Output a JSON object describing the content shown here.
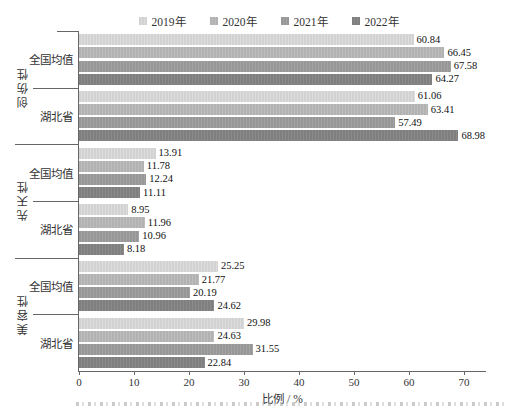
{
  "chart_data": {
    "type": "bar",
    "orientation": "horizontal",
    "title": "",
    "xlabel": "比例 / %",
    "xlim": [
      0,
      72
    ],
    "xticks": [
      0,
      10,
      20,
      30,
      40,
      50,
      60,
      70
    ],
    "grid": false,
    "legend_position": "top",
    "legend": [
      "2019年",
      "2020年",
      "2021年",
      "2022年"
    ],
    "series_colors": [
      "#d2d2d2",
      "#b2b2b2",
      "#979797",
      "#7f7f7f"
    ],
    "series_stripe_colors": [
      "#dddddd",
      "#bebebe",
      "#a3a3a3",
      "#8b8b8b"
    ],
    "groups": [
      {
        "label": "创伤性",
        "rows": [
          {
            "label": "全国均值",
            "values": [
              60.84,
              66.45,
              67.58,
              64.27
            ]
          },
          {
            "label": "湖北省",
            "values": [
              61.06,
              63.41,
              57.49,
              68.98
            ]
          }
        ]
      },
      {
        "label": "先天性",
        "rows": [
          {
            "label": "全国均值",
            "values": [
              13.91,
              11.78,
              12.24,
              11.11
            ]
          },
          {
            "label": "湖北省",
            "values": [
              8.95,
              11.96,
              10.96,
              8.18
            ]
          }
        ]
      },
      {
        "label": "美容性",
        "rows": [
          {
            "label": "全国均值",
            "values": [
              25.25,
              21.77,
              20.19,
              24.62
            ]
          },
          {
            "label": "湖北省",
            "values": [
              29.98,
              24.63,
              31.55,
              22.84
            ]
          }
        ]
      }
    ]
  }
}
